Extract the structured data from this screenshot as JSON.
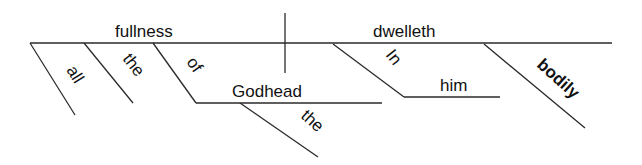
{
  "diagram": {
    "type": "sentence-diagram",
    "subject": {
      "word": "fullness",
      "modifiers": [
        {
          "word": "all",
          "role": "adjective"
        },
        {
          "word": "the",
          "role": "article"
        },
        {
          "word": "of",
          "role": "preposition",
          "object": {
            "word": "Godhead",
            "modifiers": [
              {
                "word": "the",
                "role": "article"
              }
            ]
          }
        }
      ]
    },
    "predicate": {
      "word": "dwelleth",
      "modifiers": [
        {
          "word": "In",
          "role": "preposition",
          "object": {
            "word": "him"
          }
        },
        {
          "word": "bodily",
          "role": "adverb",
          "emphasis": "bold"
        }
      ]
    }
  },
  "labels": {
    "subject": "fullness",
    "verb": "dwelleth",
    "all": "all",
    "the1": "the",
    "of": "of",
    "godhead": "Godhead",
    "the2": "the",
    "in": "In",
    "him": "him",
    "bodily": "bodily"
  },
  "colors": {
    "line": "#2a2a2a",
    "text": "#111111",
    "background": "#ffffff"
  }
}
